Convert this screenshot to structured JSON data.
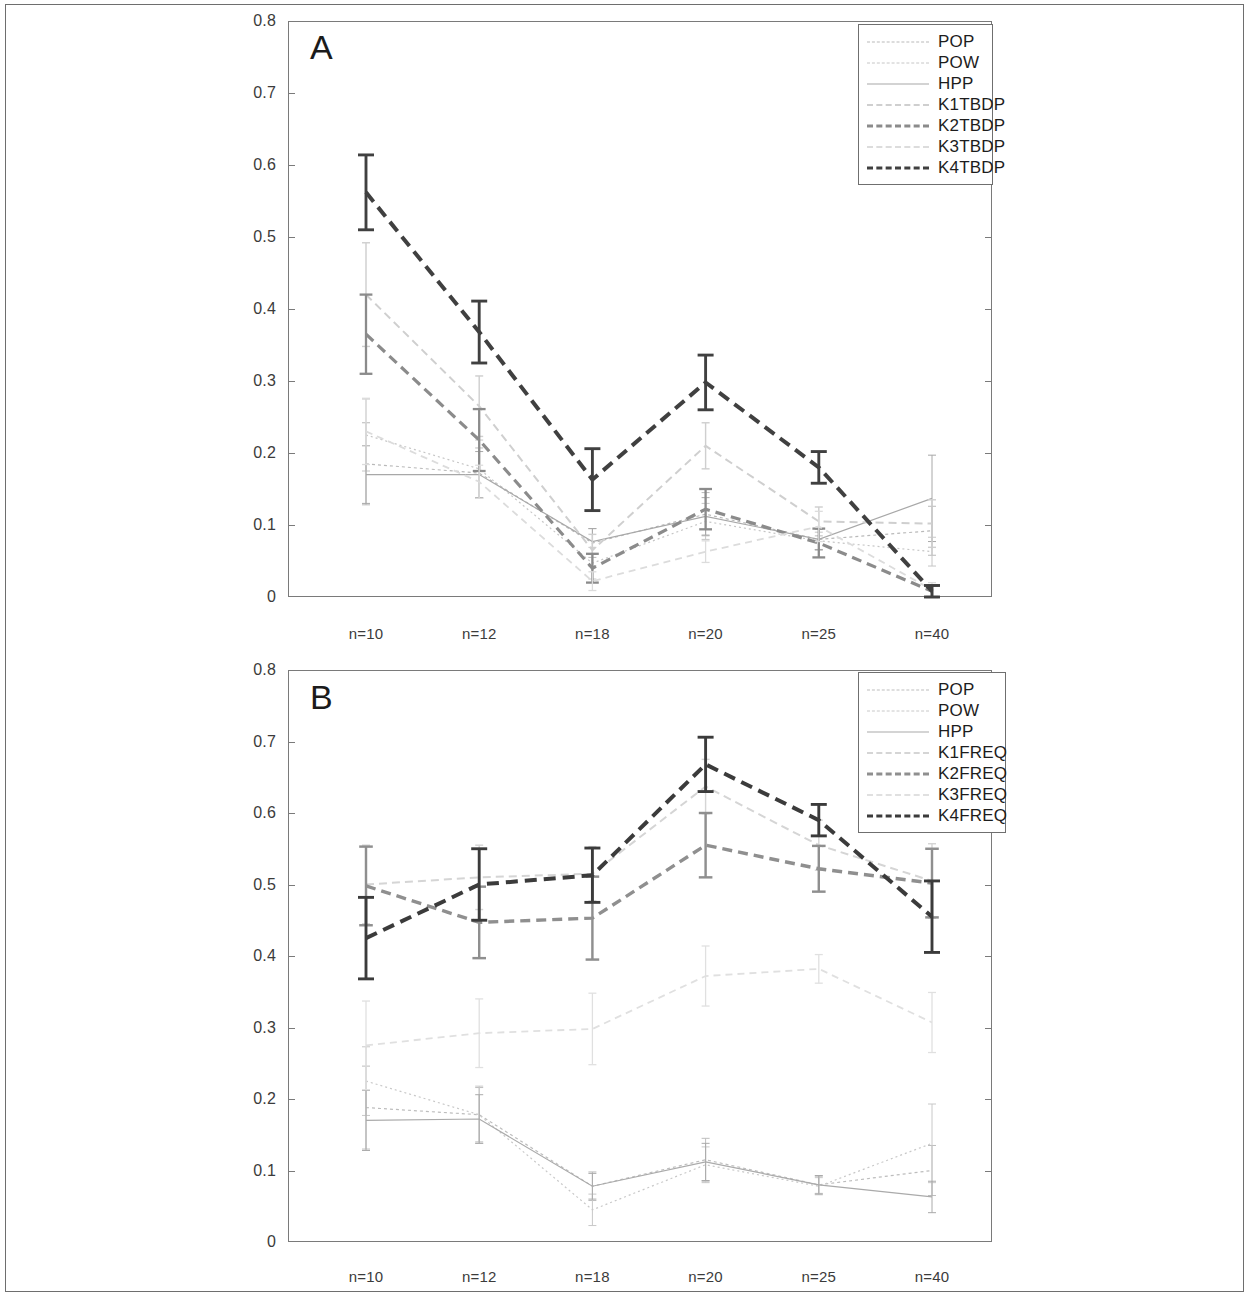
{
  "figure": {
    "outer_frame": true,
    "panels": [
      "A",
      "B"
    ]
  },
  "axis": {
    "y_ticks": [
      "0",
      "0.1",
      "0.2",
      "0.3",
      "0.4",
      "0.5",
      "0.6",
      "0.7",
      "0.8"
    ],
    "y_values": [
      0,
      0.1,
      0.2,
      0.3,
      0.4,
      0.5,
      0.6,
      0.7,
      0.8
    ],
    "x_ticks": [
      "n=10",
      "n=12",
      "n=18",
      "n=20",
      "n=25",
      "n=40"
    ]
  },
  "panelA": {
    "letter": "A",
    "legend": [
      "POP",
      "POW",
      "HPP",
      "K1TBDP",
      "K2TBDP",
      "K3TBDP",
      "K4TBDP"
    ]
  },
  "panelB": {
    "letter": "B",
    "legend": [
      "POP",
      "POW",
      "HPP",
      "K1FREQ",
      "K2FREQ",
      "K3FREQ",
      "K4FREQ"
    ]
  },
  "chart_data": [
    {
      "type": "line",
      "title": "A",
      "panel": "A",
      "xlabel": "",
      "ylabel": "",
      "ylim": [
        0,
        0.8
      ],
      "grid": false,
      "legend_position": "top-right",
      "categories": [
        "n=10",
        "n=12",
        "n=18",
        "n=20",
        "n=25",
        "n=40"
      ],
      "errorbars": true,
      "series": [
        {
          "name": "POP",
          "values": [
            0.185,
            0.172,
            0.075,
            0.115,
            0.08,
            0.092
          ],
          "err": [
            0.057,
            0.035,
            0.02,
            0.03,
            0.015,
            0.034
          ],
          "color": "#b9b9b9",
          "dash": "3,3",
          "width": 1.2
        },
        {
          "name": "POW",
          "values": [
            0.225,
            0.178,
            0.047,
            0.105,
            0.078,
            0.063
          ],
          "err": [
            0.05,
            0.04,
            0.022,
            0.025,
            0.012,
            0.02
          ],
          "color": "#c6c6c6",
          "dash": "2,3",
          "width": 1.2
        },
        {
          "name": "HPP",
          "values": [
            0.17,
            0.17,
            0.077,
            0.112,
            0.08,
            0.137
          ],
          "err": [
            0.04,
            0.032,
            0.018,
            0.026,
            0.014,
            0.06
          ],
          "color": "#a8a8a8",
          "dash": "none",
          "width": 1.2
        },
        {
          "name": "K1TBDP",
          "values": [
            0.42,
            0.265,
            0.065,
            0.21,
            0.105,
            0.102
          ],
          "err": [
            0.072,
            0.042,
            0.022,
            0.032,
            0.02,
            0.033
          ],
          "color": "#cfcfcf",
          "dash": "8,5",
          "width": 2.0
        },
        {
          "name": "K2TBDP",
          "values": [
            0.365,
            0.218,
            0.04,
            0.122,
            0.075,
            0.008
          ],
          "err": [
            0.055,
            0.043,
            0.02,
            0.028,
            0.02,
            0.008
          ],
          "color": "#8b8b8b",
          "dash": "10,6",
          "width": 3.2
        },
        {
          "name": "K3TBDP",
          "values": [
            0.23,
            0.16,
            0.022,
            0.063,
            0.098,
            0.01
          ],
          "err": [
            0.046,
            0.023,
            0.013,
            0.015,
            0.021,
            0.01
          ],
          "color": "#dcdcdc",
          "dash": "7,5",
          "width": 1.8
        },
        {
          "name": "K4TBDP",
          "values": [
            0.562,
            0.368,
            0.163,
            0.298,
            0.18,
            0.008
          ],
          "err": [
            0.052,
            0.043,
            0.043,
            0.038,
            0.022,
            0.008
          ],
          "color": "#404040",
          "dash": "12,7",
          "width": 4.0
        }
      ]
    },
    {
      "type": "line",
      "title": "B",
      "panel": "B",
      "xlabel": "",
      "ylabel": "",
      "ylim": [
        0,
        0.8
      ],
      "grid": false,
      "legend_position": "top-right",
      "categories": [
        "n=10",
        "n=12",
        "n=18",
        "n=20",
        "n=25",
        "n=40"
      ],
      "errorbars": true,
      "series": [
        {
          "name": "POP",
          "values": [
            0.188,
            0.178,
            0.078,
            0.115,
            0.08,
            0.1
          ],
          "err": [
            0.058,
            0.038,
            0.02,
            0.03,
            0.012,
            0.035
          ],
          "color": "#bdbdbd",
          "dash": "3,3",
          "width": 1.2
        },
        {
          "name": "POW",
          "values": [
            0.225,
            0.178,
            0.045,
            0.108,
            0.078,
            0.138
          ],
          "err": [
            0.048,
            0.04,
            0.022,
            0.025,
            0.012,
            0.055
          ],
          "color": "#c8c8c8",
          "dash": "2,3",
          "width": 1.2
        },
        {
          "name": "HPP",
          "values": [
            0.17,
            0.172,
            0.078,
            0.112,
            0.08,
            0.063
          ],
          "err": [
            0.042,
            0.034,
            0.018,
            0.026,
            0.013,
            0.022
          ],
          "color": "#aaaaaa",
          "dash": "none",
          "width": 1.2
        },
        {
          "name": "K1FREQ",
          "values": [
            0.5,
            0.51,
            0.515,
            0.637,
            0.555,
            0.505
          ],
          "err": [
            0.055,
            0.045,
            0.038,
            0.038,
            0.035,
            0.052
          ],
          "color": "#d5d5d5",
          "dash": "8,5",
          "width": 2.0
        },
        {
          "name": "K2FREQ",
          "values": [
            0.498,
            0.447,
            0.453,
            0.555,
            0.522,
            0.502
          ],
          "err": [
            0.055,
            0.05,
            0.058,
            0.045,
            0.032,
            0.048
          ],
          "color": "#8f8f8f",
          "dash": "10,6",
          "width": 3.4
        },
        {
          "name": "K3FREQ",
          "values": [
            0.275,
            0.292,
            0.298,
            0.372,
            0.382,
            0.307
          ],
          "err": [
            0.062,
            0.048,
            0.05,
            0.042,
            0.02,
            0.042
          ],
          "color": "#e0e0e0",
          "dash": "7,5",
          "width": 1.8
        },
        {
          "name": "K4FREQ",
          "values": [
            0.425,
            0.5,
            0.513,
            0.668,
            0.59,
            0.455
          ],
          "err": [
            0.057,
            0.05,
            0.038,
            0.038,
            0.022,
            0.05
          ],
          "color": "#3b3b3b",
          "dash": "12,7",
          "width": 4.0
        }
      ]
    }
  ]
}
